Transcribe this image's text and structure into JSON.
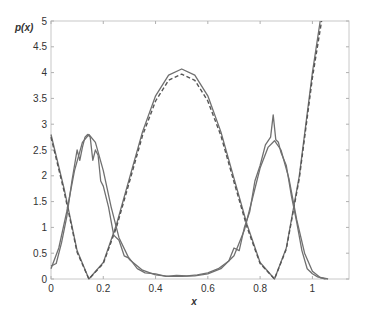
{
  "chart_data": {
    "type": "line",
    "title": "",
    "xlabel": "x",
    "ylabel": "p(x)",
    "xlim": [
      0,
      1.14
    ],
    "ylim": [
      0,
      5
    ],
    "grid": false,
    "legend": null,
    "xticks": [
      "0",
      "0.2",
      "0.4",
      "0.6",
      "0.8",
      "1"
    ],
    "yticks": [
      "0",
      "0.5",
      "1",
      "1.5",
      "2",
      "2.5",
      "3",
      "3.5",
      "4",
      "4.5",
      "5"
    ],
    "series": [
      {
        "name": "U-shaped density (solid)",
        "style": "solid",
        "x": [
          0,
          0.05,
          0.1,
          0.145,
          0.2,
          0.25,
          0.3,
          0.35,
          0.4,
          0.45,
          0.5,
          0.55,
          0.6,
          0.65,
          0.7,
          0.75,
          0.8,
          0.855,
          0.9,
          0.95,
          1.0,
          1.03
        ],
        "y": [
          2.8,
          1.75,
          0.55,
          0.0,
          0.32,
          1.05,
          1.95,
          2.85,
          3.55,
          3.95,
          4.07,
          3.95,
          3.55,
          2.85,
          1.95,
          1.05,
          0.32,
          0.0,
          0.6,
          2.0,
          4.0,
          5.0
        ]
      },
      {
        "name": "U-shaped density (dashed)",
        "style": "dashed",
        "x": [
          0,
          0.05,
          0.1,
          0.145,
          0.2,
          0.25,
          0.3,
          0.35,
          0.4,
          0.45,
          0.5,
          0.55,
          0.6,
          0.65,
          0.7,
          0.75,
          0.8,
          0.855,
          0.9,
          0.95,
          1.0,
          1.035
        ],
        "y": [
          2.75,
          1.7,
          0.52,
          0.0,
          0.3,
          1.0,
          1.88,
          2.78,
          3.45,
          3.85,
          3.97,
          3.85,
          3.45,
          2.78,
          1.88,
          1.0,
          0.3,
          0.0,
          0.58,
          1.95,
          3.9,
          5.0
        ]
      },
      {
        "name": "Bimodal density (smooth)",
        "style": "solid",
        "x": [
          0,
          0.03,
          0.06,
          0.09,
          0.12,
          0.145,
          0.17,
          0.2,
          0.23,
          0.26,
          0.3,
          0.35,
          0.4,
          0.45,
          0.5,
          0.55,
          0.6,
          0.65,
          0.7,
          0.74,
          0.77,
          0.8,
          0.83,
          0.855,
          0.88,
          0.91,
          0.94,
          0.97,
          1.0,
          1.03,
          1.06
        ],
        "y": [
          0.2,
          0.6,
          1.3,
          2.1,
          2.65,
          2.8,
          2.65,
          2.1,
          1.4,
          0.8,
          0.38,
          0.17,
          0.08,
          0.05,
          0.05,
          0.06,
          0.1,
          0.2,
          0.45,
          0.95,
          1.55,
          2.15,
          2.55,
          2.68,
          2.5,
          1.95,
          1.15,
          0.5,
          0.15,
          0.03,
          0.0
        ]
      },
      {
        "name": "Bimodal density (empirical, noisy)",
        "style": "solid",
        "x": [
          0,
          0.02,
          0.04,
          0.06,
          0.08,
          0.1,
          0.11,
          0.12,
          0.13,
          0.14,
          0.15,
          0.16,
          0.17,
          0.18,
          0.19,
          0.2,
          0.22,
          0.24,
          0.26,
          0.28,
          0.3,
          0.33,
          0.36,
          0.4,
          0.44,
          0.48,
          0.52,
          0.56,
          0.6,
          0.64,
          0.68,
          0.7,
          0.72,
          0.74,
          0.76,
          0.78,
          0.8,
          0.82,
          0.84,
          0.85,
          0.86,
          0.87,
          0.88,
          0.9,
          0.92,
          0.94,
          0.96,
          0.98,
          1.0,
          1.02,
          1.05
        ],
        "y": [
          0.25,
          0.3,
          0.7,
          1.2,
          1.9,
          2.5,
          2.3,
          2.55,
          2.75,
          2.8,
          2.75,
          2.3,
          2.5,
          2.4,
          1.9,
          1.8,
          1.4,
          0.85,
          0.75,
          0.45,
          0.4,
          0.2,
          0.12,
          0.1,
          0.05,
          0.07,
          0.06,
          0.08,
          0.12,
          0.2,
          0.35,
          0.6,
          0.55,
          1.0,
          1.3,
          1.9,
          2.2,
          2.6,
          2.75,
          3.18,
          2.7,
          2.65,
          2.45,
          2.2,
          1.6,
          1.1,
          0.55,
          0.2,
          0.1,
          0.04,
          0.0
        ]
      }
    ]
  }
}
